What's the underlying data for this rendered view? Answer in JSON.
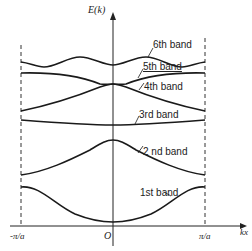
{
  "figure": {
    "y_axis_label": "E(k)",
    "x_axis_label": "kx",
    "origin_label": "O",
    "x_left_label": "-π/a",
    "x_right_label": "π/a",
    "bands": [
      {
        "label": "1st band"
      },
      {
        "label": "2 nd band"
      },
      {
        "label": "3rd band"
      },
      {
        "label": "4th band"
      },
      {
        "label": "5th band"
      },
      {
        "label": "6th band"
      }
    ],
    "colors": {
      "line": "#1a1a1a",
      "background": "#ffffff"
    }
  }
}
